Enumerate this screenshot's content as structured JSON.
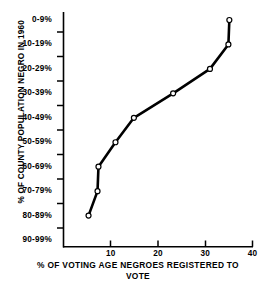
{
  "chart_data": {
    "type": "line",
    "title": "",
    "xlabel": "% OF  VOTING AGE NEGROES REGISTERED TO VOTE",
    "ylabel": "% OF COUNTY POPULATION NEGRO IN 1960",
    "orientation": "y-categorical-descending",
    "grid": false,
    "legend": null,
    "marker": "open-circle",
    "line_color": "#000000",
    "marker_fill": "#ffffff",
    "xlim": [
      0,
      40
    ],
    "xticks": [
      10,
      20,
      30,
      40
    ],
    "xtick_labels": [
      "10",
      "20",
      "30",
      "40"
    ],
    "x_minor_ticks": [],
    "ycategories": [
      "0-9%",
      "10-19%",
      "20-29%",
      "30-39%",
      "40-49%",
      "50-59%",
      "60-69%",
      "70-79%",
      "80-89%",
      "90-99%"
    ],
    "points": [
      {
        "category": "0-9%",
        "x": 35.1
      },
      {
        "category": "10-19%",
        "x": 34.9
      },
      {
        "category": "20-29%",
        "x": 31.0
      },
      {
        "category": "30-39%",
        "x": 23.2
      },
      {
        "category": "40-49%",
        "x": 14.9
      },
      {
        "category": "50-59%",
        "x": 11.0
      },
      {
        "category": "60-69%",
        "x": 7.4
      },
      {
        "category": "70-79%",
        "x": 7.2
      },
      {
        "category": "80-89%",
        "x": 5.3
      },
      {
        "category": "90-99%",
        "x": null
      }
    ],
    "values": [
      35.1,
      34.9,
      31.0,
      23.2,
      14.9,
      11.0,
      7.4,
      7.2,
      5.3,
      null
    ]
  },
  "axes": {
    "x_title_line1": "% OF  VOTING AGE NEGROES REGISTERED TO",
    "x_title_line2": "VOTE",
    "y_title": "% OF COUNTY POPULATION NEGRO IN 1960",
    "ytick_labels": [
      "0-9%",
      "10-19%",
      "20-29%",
      "30-39%",
      "40-49%",
      "50-59%",
      "60-69%",
      "70-79%",
      "80-89%",
      "90-99%"
    ],
    "xtick_labels": [
      "10",
      "20",
      "30",
      "40"
    ]
  }
}
